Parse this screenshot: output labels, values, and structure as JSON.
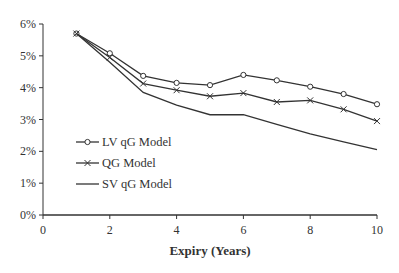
{
  "chart_data": {
    "type": "line",
    "title": "",
    "xlabel": "Expiry (Years)",
    "ylabel": "",
    "xlim": [
      0,
      10
    ],
    "ylim": [
      0,
      6
    ],
    "x_ticks": [
      "0",
      "2",
      "4",
      "6",
      "8",
      "10"
    ],
    "y_ticks": [
      "0%",
      "1%",
      "2%",
      "3%",
      "4%",
      "5%",
      "6%"
    ],
    "grid": false,
    "legend_position": "inside-left",
    "x": [
      1,
      2,
      3,
      4,
      5,
      6,
      7,
      8,
      9,
      10
    ],
    "series": [
      {
        "name": "LV qG Model",
        "marker": "circle",
        "values": [
          5.7,
          5.08,
          4.37,
          4.15,
          4.08,
          4.4,
          4.23,
          4.03,
          3.8,
          3.48
        ]
      },
      {
        "name": "QG Model",
        "marker": "x",
        "values": [
          5.7,
          4.95,
          4.13,
          3.92,
          3.73,
          3.83,
          3.55,
          3.6,
          3.32,
          2.95
        ]
      },
      {
        "name": "SV qG Model",
        "marker": "none",
        "values": [
          5.7,
          4.8,
          3.85,
          3.45,
          3.15,
          3.15,
          2.85,
          2.55,
          2.3,
          2.05
        ]
      }
    ]
  }
}
